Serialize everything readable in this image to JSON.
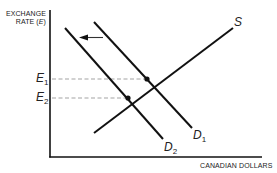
{
  "diagram": {
    "y_axis_label_line1": "EXCHANGE",
    "y_axis_label_line2": "RATE (",
    "y_axis_label_symbol": "E",
    "y_axis_label_close": ")",
    "x_axis_label": "CANADIAN DOLLARS",
    "curves": {
      "supply": {
        "label": "S"
      },
      "demand1": {
        "label": "D",
        "sub": "1"
      },
      "demand2": {
        "label": "D",
        "sub": "2"
      }
    },
    "equilibria": {
      "e1": {
        "label": "E",
        "sub": "1"
      },
      "e2": {
        "label": "E",
        "sub": "2"
      }
    },
    "arrow": "shift-left",
    "colors": {
      "line": "#111111",
      "dash": "#999999"
    }
  }
}
